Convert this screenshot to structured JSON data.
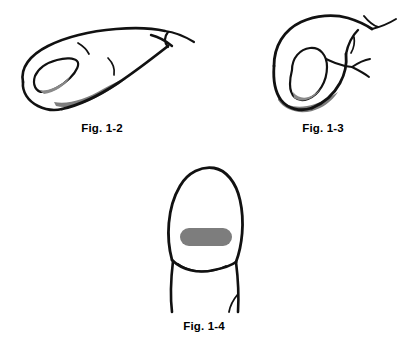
{
  "page": {
    "background_color": "#ffffff",
    "width": 402,
    "height": 345
  },
  "style": {
    "ink_color": "#111111",
    "shade_gray": "#7d7d7d",
    "nail_shade_gray": "#8a8a8a",
    "caption_color": "#000000"
  },
  "figures": [
    {
      "id": "fig-1-2",
      "caption": "Fig. 1-2",
      "view": "side view of fingertip angled upward to the right",
      "parts": [
        "finger-outline",
        "fingernail",
        "nail-shading",
        "knuckle-crease",
        "joint-crease"
      ]
    },
    {
      "id": "fig-1-3",
      "caption": "Fig. 1-3",
      "view": "hooked fingertip curving downward",
      "parts": [
        "finger-outline",
        "fingernail",
        "nail-shading",
        "knuckle-crease",
        "joint-crease"
      ]
    },
    {
      "id": "fig-1-4",
      "caption": "Fig. 1-4",
      "view": "frontal palmar view of finger with shaded pad",
      "parts": [
        "finger-outline",
        "finger-pad-shade",
        "joint-crease",
        "side-crease"
      ]
    }
  ]
}
